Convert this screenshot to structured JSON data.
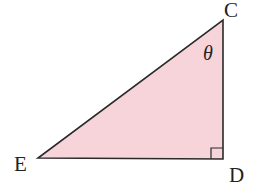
{
  "diagram": {
    "type": "right-triangle",
    "fill_color": "#f7d4da",
    "stroke_color": "#2a2a2a",
    "vertices": {
      "C": {
        "label": "C",
        "x": 223,
        "y": 20
      },
      "D": {
        "label": "D",
        "x": 223,
        "y": 159
      },
      "E": {
        "label": "E",
        "x": 38,
        "y": 158
      }
    },
    "angle_label": "θ",
    "angle_at": "C",
    "right_angle_at": "D"
  }
}
